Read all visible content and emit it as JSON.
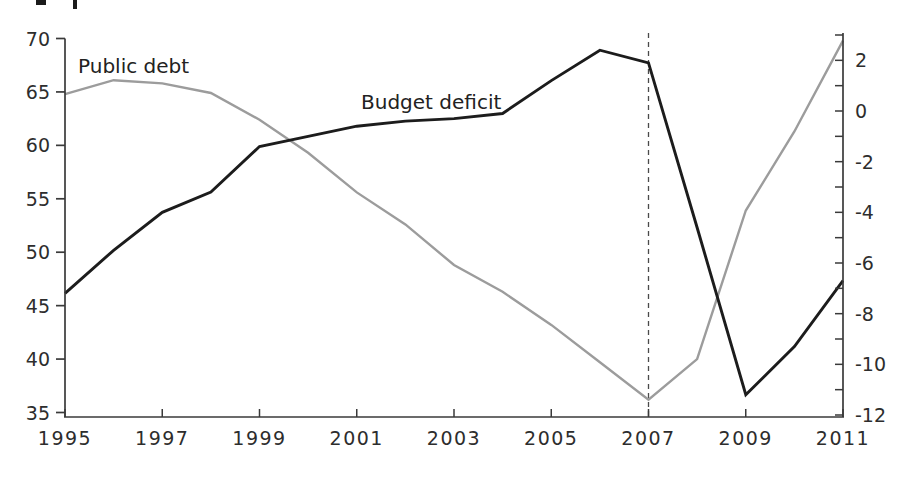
{
  "chart_data": {
    "type": "line",
    "title": "",
    "xlabel": "",
    "ylabel_left": "",
    "ylabel_right": "",
    "x": [
      1995,
      1996,
      1997,
      1998,
      1999,
      2000,
      2001,
      2002,
      2003,
      2004,
      2005,
      2006,
      2007,
      2008,
      2009,
      2010,
      2011
    ],
    "x_tick_labels": [
      "1995",
      "1997",
      "1999",
      "2001",
      "2003",
      "2005",
      "2007",
      "2009",
      "2011"
    ],
    "left_axis": {
      "min": 35,
      "max": 70,
      "tick_labels": [
        "70",
        "65",
        "60",
        "55",
        "50",
        "45",
        "40",
        "35"
      ],
      "tick_values": [
        70,
        65,
        60,
        55,
        50,
        45,
        40,
        35
      ]
    },
    "right_axis": {
      "min": -12,
      "max": 3,
      "minor_tick_step": 1,
      "tick_labels": [
        "2",
        "0",
        "-2",
        "-4",
        "-6",
        "-8",
        "-10",
        "-12"
      ],
      "tick_values": [
        2,
        0,
        -2,
        -4,
        -6,
        -8,
        -10,
        -12
      ]
    },
    "series": [
      {
        "name": "Public debt",
        "axis": "left",
        "color": "#9c9c9c",
        "values": [
          64.8,
          66.1,
          65.8,
          64.9,
          62.4,
          59.3,
          55.6,
          52.6,
          48.8,
          46.3,
          43.2,
          39.7,
          36.2,
          40.0,
          53.9,
          61.3,
          69.8
        ]
      },
      {
        "name": "Budget deficit",
        "axis": "right",
        "color": "#1c1c1c",
        "values": [
          -7.2,
          -5.5,
          -4.0,
          -3.2,
          -1.4,
          -1.0,
          -0.6,
          -0.4,
          -0.3,
          -0.1,
          1.2,
          2.4,
          1.9,
          -4.6,
          -11.2,
          -9.3,
          -6.7
        ]
      }
    ],
    "series_labels": [
      {
        "text": "Public debt",
        "px": 78,
        "py": 73
      },
      {
        "text": "Budget deficit",
        "px": 361,
        "py": 109
      }
    ],
    "annotations": {
      "dashed_vertical_line_at_x": 2007
    },
    "grid": "off",
    "legend": "inline-labels",
    "colors": {
      "public_debt_line": "#9c9c9c",
      "budget_deficit_line": "#1c1c1c",
      "axis": "#3a3a3a",
      "dashed_line": "#4a4a4a",
      "text": "#2d2d2d",
      "background": "#ffffff"
    }
  }
}
